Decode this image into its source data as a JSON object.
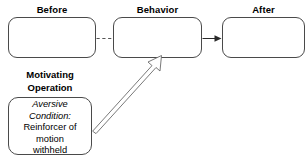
{
  "diagram": {
    "title": "",
    "columns": [
      {
        "header": "Before",
        "body": ""
      },
      {
        "header": "Behavior",
        "body": ""
      },
      {
        "header": "After",
        "body": ""
      }
    ],
    "motivating_operation": {
      "heading_line1": "Motivating",
      "heading_line2": "Operation",
      "italic_line1": "Aversive",
      "italic_line2": "Condition:",
      "plain_line1": "Reinforcer of",
      "plain_line2": "motion",
      "plain_line3": "withheld"
    },
    "connectors": [
      {
        "name": "before-to-behavior",
        "style": "dashed",
        "arrowhead": false
      },
      {
        "name": "behavior-to-after",
        "style": "solid",
        "arrowhead": true
      },
      {
        "name": "mo-to-behavior",
        "style": "hollow-outline",
        "arrowhead": true
      }
    ],
    "colors": {
      "border": "#4a4a4a",
      "text": "#000000",
      "background": "#ffffff",
      "connector": "#555555"
    }
  }
}
